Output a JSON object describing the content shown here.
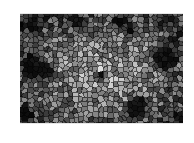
{
  "image": {
    "description": "Grayscale cellular (Voronoi-like) mosaic texture with scattered dark patches",
    "colors": {
      "background": "#ffffff",
      "cell_dark": "#050505",
      "cell_mid": "#7a7a7a",
      "cell_light": "#d8d8d8",
      "cell_edge": "#3a3a3a"
    }
  }
}
